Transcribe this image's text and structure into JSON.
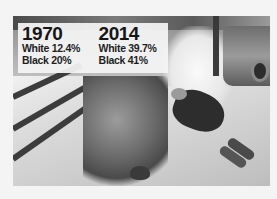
{
  "stats": {
    "left": {
      "year": "1970",
      "white": "White 12.4%",
      "black": "Black 20%"
    },
    "right": {
      "year": "2014",
      "white": "White 39.7%",
      "black": "Black 41%"
    }
  },
  "photo": {
    "description": "Black-and-white photo of a person lying face-down on a sunlit pavement beside steps, shrubs, a hat and a parked car"
  }
}
